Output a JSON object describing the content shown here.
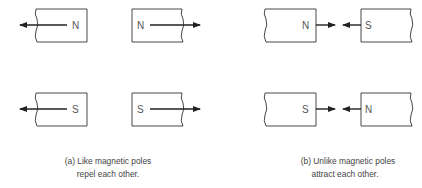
{
  "figure": {
    "panel_a": {
      "caption_line1": "(a) Like magnetic poles",
      "caption_line2": "repel each other.",
      "rows": [
        {
          "left_magnet_pole": "N",
          "right_magnet_pole": "N"
        },
        {
          "left_magnet_pole": "S",
          "right_magnet_pole": "S"
        }
      ]
    },
    "panel_b": {
      "caption_line1": "(b) Unlike magnetic poles",
      "caption_line2": "attract each other.",
      "rows": [
        {
          "left_magnet_pole": "N",
          "right_magnet_pole": "S"
        },
        {
          "left_magnet_pole": "S",
          "right_magnet_pole": "N"
        }
      ]
    },
    "colors": {
      "line": "#222222",
      "text": "#555555"
    }
  }
}
